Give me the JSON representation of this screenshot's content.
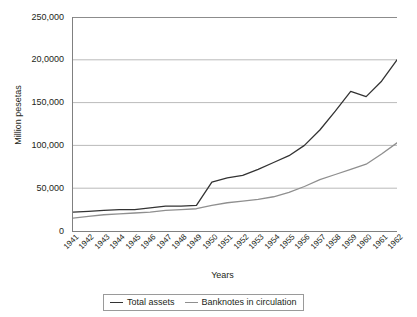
{
  "chart_data": {
    "type": "line",
    "title": "",
    "xlabel": "Years",
    "ylabel": "Million pesetas",
    "ylim": [
      0,
      250000
    ],
    "grid": true,
    "legend_position": "bottom",
    "y_ticks": [
      {
        "value": 250000,
        "label": "250,000"
      },
      {
        "value": 200000,
        "label": "20,0000"
      },
      {
        "value": 150000,
        "label": "150,000"
      },
      {
        "value": 100000,
        "label": "100,000"
      },
      {
        "value": 50000,
        "label": "50,000"
      },
      {
        "value": 0,
        "label": "0"
      }
    ],
    "categories": [
      "1941",
      "1942",
      "1943",
      "1944",
      "1945",
      "1946",
      "1947",
      "1948",
      "1949",
      "1950",
      "1951",
      "1952",
      "1953",
      "1954",
      "1955",
      "1956",
      "1957",
      "1958",
      "1959",
      "1960",
      "1961",
      "1962"
    ],
    "series": [
      {
        "name": "Total assets",
        "color": "#333333",
        "values": [
          22000,
          23000,
          24000,
          25000,
          25000,
          27000,
          29000,
          29000,
          30000,
          57000,
          62000,
          65000,
          72000,
          80000,
          88000,
          100000,
          118000,
          140000,
          163000,
          157000,
          175000,
          200000
        ]
      },
      {
        "name": "Banknotes in circulation",
        "color": "#8f8f8f",
        "values": [
          15000,
          17000,
          19000,
          20000,
          21000,
          22000,
          24000,
          25000,
          26000,
          30000,
          33000,
          35000,
          37000,
          40000,
          45000,
          52000,
          60000,
          66000,
          72000,
          78000,
          90000,
          103000
        ]
      }
    ]
  },
  "legend": {
    "items": [
      {
        "label": "Total assets",
        "color": "#333333"
      },
      {
        "label": "Banknotes in circulation",
        "color": "#8f8f8f"
      }
    ]
  }
}
